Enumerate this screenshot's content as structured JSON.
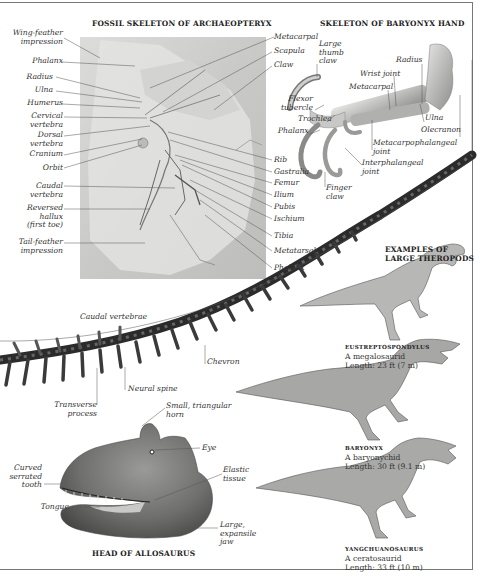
{
  "archaeopteryx": {
    "title": "FOSSIL SKELETON OF ARCHAEOPTERYX",
    "left_labels": [
      {
        "text": "Wing-feather\nimpression"
      },
      {
        "text": "Phalanx"
      },
      {
        "text": "Radius"
      },
      {
        "text": "Ulna"
      },
      {
        "text": "Humerus"
      },
      {
        "text": "Cervical\nvertebra"
      },
      {
        "text": "Dorsal\nvertebra"
      },
      {
        "text": "Cranium"
      },
      {
        "text": "Orbit"
      },
      {
        "text": "Caudal\nvertebra"
      },
      {
        "text": "Reversed\nhallux\n(first toe)"
      },
      {
        "text": "Tail-feather\nimpression"
      }
    ],
    "right_labels": [
      {
        "text": "Metacarpal"
      },
      {
        "text": "Scapula"
      },
      {
        "text": "Claw"
      },
      {
        "text": "Rib"
      },
      {
        "text": "Gastralia"
      },
      {
        "text": "Femur"
      },
      {
        "text": "Ilium"
      },
      {
        "text": "Pubis"
      },
      {
        "text": "Ischium"
      },
      {
        "text": "Tibia"
      },
      {
        "text": "Metatarsal"
      },
      {
        "text": "Phalanx"
      }
    ]
  },
  "baryonyx_hand": {
    "title": "SKELETON OF BARYONYX HAND",
    "labels": {
      "thumb_claw": "Large\nthumb\nclaw",
      "radius": "Radius",
      "wrist_joint": "Wrist joint",
      "metacarpal": "Metacarpal",
      "flexor_tubercle": "Flexor\ntubercle",
      "trochlea": "Trochlea",
      "phalanx": "Phalanx",
      "ulna": "Ulna",
      "olecranon": "Olecranon",
      "metacarpophalangeal": "Metacarpophalangeal\njoint",
      "interphalangeal": "Interphalangeal\njoint",
      "finger_claw": "Finger\nclaw"
    }
  },
  "tail": {
    "labels": {
      "caudal_vertebrae": "Caudal vertebrae",
      "chevron": "Chevron",
      "neural_spine": "Neural spine",
      "transverse_process": "Transverse\nprocess"
    }
  },
  "theropods": {
    "title": "EXAMPLES OF\nLARGE THEROPODS",
    "examples": [
      {
        "name": "EUSTREPTOSPONDYLUS",
        "type": "A megalosaurid",
        "length": "Length: 23 ft (7 m)"
      },
      {
        "name": "BARYONYX",
        "type": "A baryonychid",
        "length": "Length: 30 ft (9.1 m)"
      },
      {
        "name": "YANGCHUANOSAURUS",
        "type": "A ceratosaurid",
        "length": "Length: 33 ft (10 m)"
      }
    ]
  },
  "allosaurus_head": {
    "title": "HEAD OF ALLOSAURUS",
    "labels": {
      "horn": "Small, triangular\nhorn",
      "eye": "Eye",
      "tooth": "Curved\nserrated\ntooth",
      "elastic": "Elastic\ntissue",
      "tongue": "Tongue",
      "jaw": "Large,\nexpansile\njaw"
    }
  }
}
